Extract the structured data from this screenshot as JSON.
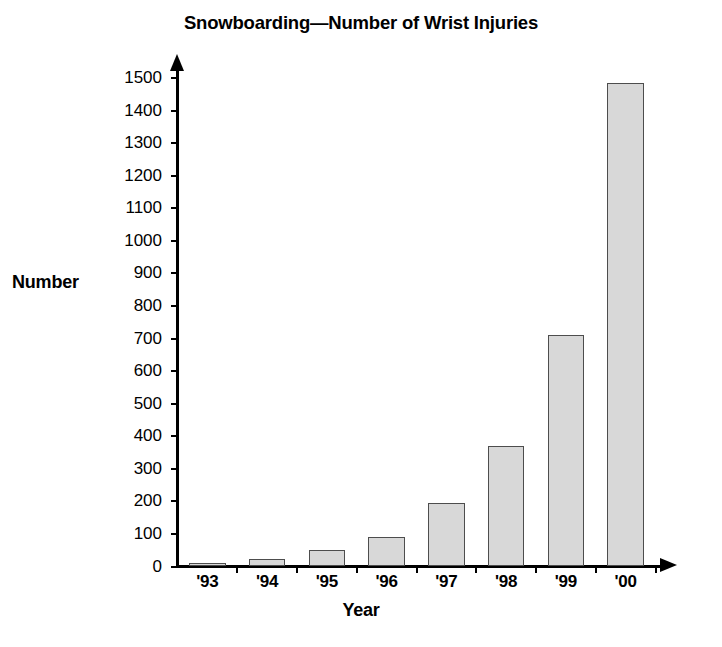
{
  "chart_data": {
    "type": "bar",
    "title": "Snowboarding—Number of Wrist Injuries",
    "xlabel": "Year",
    "ylabel": "Number",
    "categories": [
      "'93",
      "'94",
      "'95",
      "'96",
      "'97",
      "'98",
      "'99",
      "'00"
    ],
    "values": [
      10,
      22,
      50,
      92,
      195,
      370,
      710,
      1485
    ],
    "ylim": [
      0,
      1500
    ],
    "ytick_step": 100,
    "yticks": [
      0,
      100,
      200,
      300,
      400,
      500,
      600,
      700,
      800,
      900,
      1000,
      1100,
      1200,
      1300,
      1400,
      1500
    ],
    "ytick_labels": [
      "0",
      "100",
      "200",
      "300",
      "400",
      "500",
      "600",
      "700",
      "800",
      "900",
      "1000",
      "1100",
      "1200",
      "1300",
      "1400",
      "1500"
    ],
    "grid": false,
    "legend": false,
    "bar_fill_color": "#d8d8d8",
    "bar_edge_color": "#4d4d4d",
    "axis_color": "#000000"
  }
}
